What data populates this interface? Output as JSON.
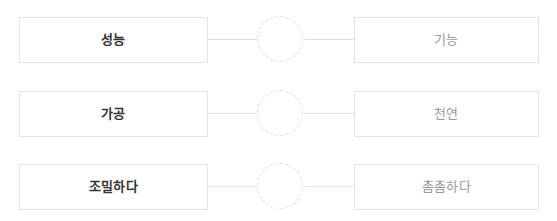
{
  "exercise": {
    "rows": [
      {
        "left_label": "성능",
        "right_label": "기능",
        "connector_icon": "dashed-circle-icon"
      },
      {
        "left_label": "가공",
        "right_label": "천연",
        "connector_icon": "dashed-circle-icon"
      },
      {
        "left_label": "조밀하다",
        "right_label": "촘촘하다",
        "connector_icon": "dashed-circle-icon"
      }
    ],
    "colors": {
      "box_border": "#e3e3e3",
      "left_text": "#333333",
      "right_text": "#9a9a9a",
      "connector_line": "#e0e0e0",
      "connector_node_border": "#e2dada",
      "background": "#ffffff"
    }
  }
}
